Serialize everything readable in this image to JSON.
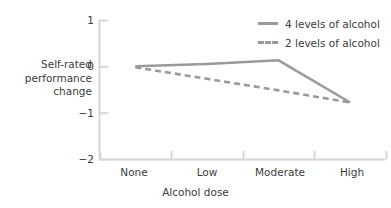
{
  "chart_data": {
    "type": "line",
    "title": "",
    "subtitle": "",
    "xlabel": "Alcohol dose",
    "ylabel": "Self-rated performance change",
    "ylabel_lines": [
      "Self-rated",
      "performance",
      "change"
    ],
    "categories": [
      "None",
      "Low",
      "Moderate",
      "High"
    ],
    "yticks": [
      "1",
      "0",
      "−1",
      "−2"
    ],
    "ytick_values": [
      1,
      0,
      -1,
      -2
    ],
    "ylim": [
      -2,
      1
    ],
    "grid": false,
    "legend_position": "top-right",
    "series": [
      {
        "name": "4 levels of alcohol",
        "style": "solid",
        "color": "#9a9a9a",
        "values": [
          0.0,
          0.05,
          0.13,
          -0.78
        ]
      },
      {
        "name": "2 levels of alcohol",
        "style": "dashed",
        "color": "#9a9a9a",
        "values": [
          -0.02,
          -0.27,
          -0.52,
          -0.78
        ]
      }
    ]
  },
  "colors": {
    "line": "#9a9a9a",
    "axis": "#d6d6d6",
    "text": "#3b3b3b",
    "background": "#ffffff"
  }
}
